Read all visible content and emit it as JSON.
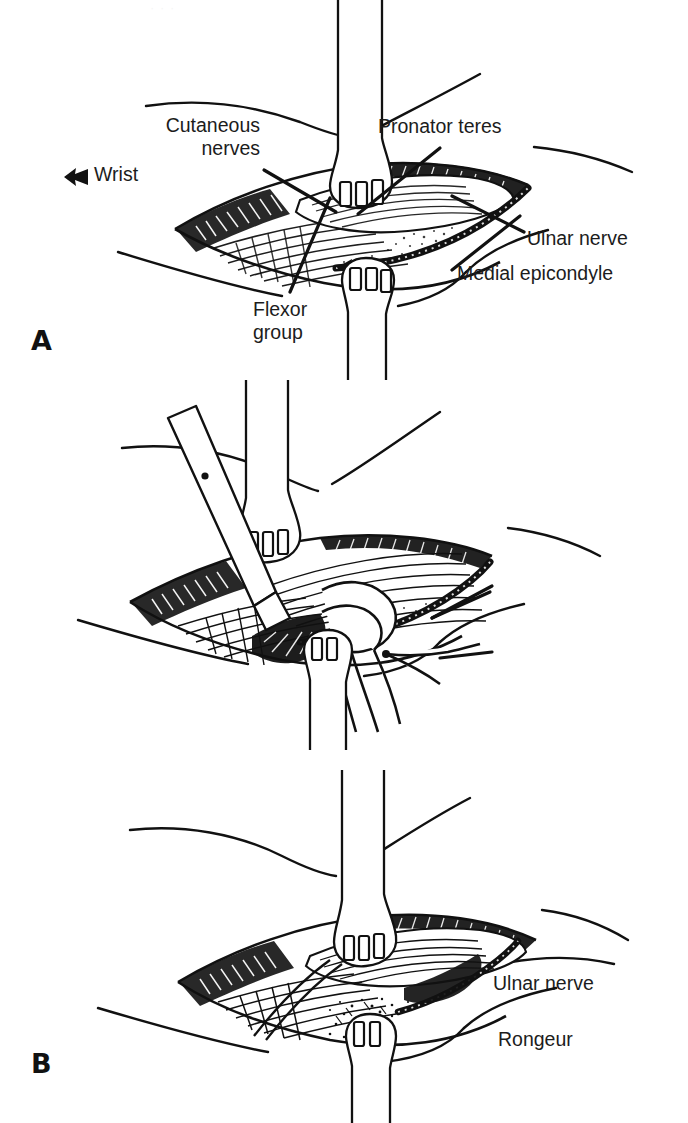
{
  "figure": {
    "caption_visible": false,
    "background_color": "#ffffff",
    "ink_color": "#111111",
    "panels": [
      {
        "letter": "A",
        "labels": [
          {
            "key": "cutaneous",
            "text": "Cutaneous\nnerves",
            "align": "right"
          },
          {
            "key": "pronator",
            "text": "Pronator teres",
            "align": "left"
          },
          {
            "key": "wrist",
            "text": "Wrist",
            "align": "left",
            "marker": "left-arrow-icon"
          },
          {
            "key": "ulnar",
            "text": "Ulnar nerve",
            "align": "left"
          },
          {
            "key": "medial",
            "text": "Medial epicondyle",
            "align": "left"
          },
          {
            "key": "flexor",
            "text": "Flexor\ngroup",
            "align": "left"
          }
        ]
      },
      {
        "letter": "B",
        "labels": [
          {
            "key": "ulnar",
            "text": "Ulnar nerve",
            "align": "left"
          },
          {
            "key": "rongeur",
            "text": "Rongeur",
            "align": "left"
          }
        ]
      },
      {
        "letter": "C",
        "labels": []
      }
    ]
  },
  "panel_a": {
    "letter": "A",
    "cutaneous_nerves": "Cutaneous\nnerves",
    "pronator_teres": "Pronator teres",
    "wrist": "Wrist",
    "ulnar_nerve": "Ulnar nerve",
    "medial_epicondyle": "Medial epicondyle",
    "flexor_group": "Flexor\ngroup"
  },
  "panel_b": {
    "letter": "B",
    "ulnar_nerve": "Ulnar nerve",
    "rongeur": "Rongeur"
  },
  "panel_c": {
    "letter": "C"
  },
  "artifacts": {
    "top_bleed_through": "· · ·"
  }
}
